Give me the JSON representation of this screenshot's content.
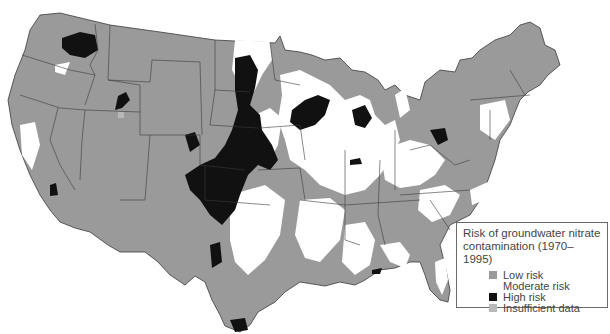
{
  "map": {
    "title": "Risk of groundwater nitrate contamination (1970–1995)",
    "region": "Contiguous United States",
    "colors": {
      "low_risk": "#9a9a9a",
      "moderate_risk": "#ffffff",
      "high_risk": "#111111",
      "insufficient_data": "#b8b8b8",
      "state_border": "#3a3a3a"
    }
  },
  "legend": {
    "title_line1": "Risk of groundwater nitrate",
    "title_line2": "contamination (1970–1995)",
    "items": [
      {
        "label": "Low risk",
        "color": "#9a9a9a"
      },
      {
        "label": "Moderate risk",
        "color": "#ffffff"
      },
      {
        "label": "High risk",
        "color": "#111111"
      },
      {
        "label": "Insufficient data",
        "color": "#b8b8b8"
      }
    ]
  }
}
